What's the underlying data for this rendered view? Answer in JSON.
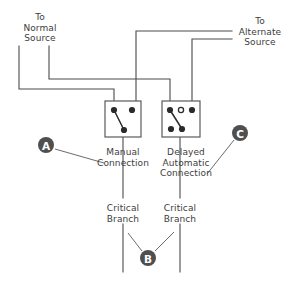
{
  "diagram": {
    "labels": {
      "normal_source": "To\nNormal\nSource",
      "alternate_source": "To\nAlternate\nSource",
      "manual_connection": "Manual\nConnection",
      "delayed_automatic_connection": "Delayed\nAutomatic\nConnection",
      "critical_branch_left": "Critical\nBranch",
      "critical_branch_right": "Critical\nBranch"
    },
    "callouts": [
      {
        "id": "A",
        "letter": "A",
        "cx": 46,
        "cy": 145,
        "leader_to_x": 104,
        "leader_to_y": 163
      },
      {
        "id": "B",
        "letter": "B",
        "cx": 148,
        "cy": 258,
        "leader_a_x": 128,
        "leader_a_y": 235,
        "leader_b_x": 173,
        "leader_b_y": 233
      },
      {
        "id": "C",
        "letter": "C",
        "cx": 240,
        "cy": 133,
        "leader_to_x": 207,
        "leader_to_y": 174
      }
    ],
    "switches": [
      {
        "id": "manual",
        "name": "Manual Connection Switch",
        "x": 105,
        "y": 101,
        "width": 36,
        "height": 36,
        "terminals": [
          {
            "name": "top-left",
            "type": "filled",
            "cx": 114,
            "cy": 110
          },
          {
            "name": "top-right",
            "type": "filled",
            "cx": 132,
            "cy": 110
          },
          {
            "name": "bottom-center",
            "type": "filled",
            "cx": 124,
            "cy": 130
          }
        ],
        "blade": {
          "from_x": 114,
          "from_y": 110,
          "to_x": 124,
          "to_y": 130
        }
      },
      {
        "id": "delayed-automatic",
        "name": "Delayed Automatic Connection Switch",
        "x": 162,
        "y": 101,
        "width": 38,
        "height": 36,
        "terminals": [
          {
            "name": "top-left",
            "type": "filled",
            "cx": 170,
            "cy": 110
          },
          {
            "name": "top-center",
            "type": "open",
            "cx": 181,
            "cy": 110
          },
          {
            "name": "top-right",
            "type": "filled",
            "cx": 192,
            "cy": 110
          },
          {
            "name": "bottom-left",
            "type": "filled",
            "cx": 171,
            "cy": 129
          },
          {
            "name": "bottom-right",
            "type": "filled",
            "cx": 182,
            "cy": 129
          }
        ],
        "blade": {
          "from_x": 170,
          "from_y": 110,
          "to_x": 182,
          "to_y": 129
        }
      }
    ],
    "colors": {
      "wire": "#4a4a4a",
      "terminal": "#2b2b2b",
      "callout": "#4f4f4f",
      "text": "#3d3d3d",
      "background": "#ffffff"
    }
  }
}
